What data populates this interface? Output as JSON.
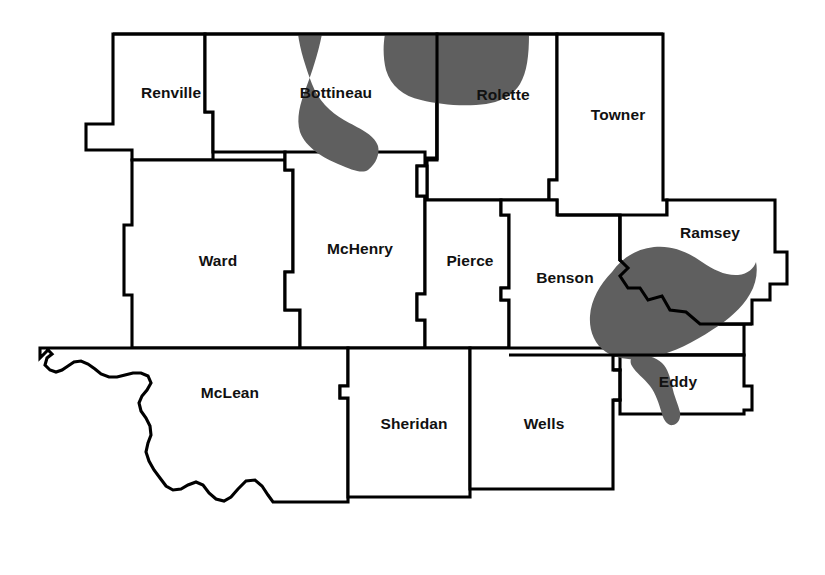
{
  "map": {
    "title": "North Dakota North Central Counties Map",
    "background_color": "#ffffff",
    "outline_color": "#000000",
    "water_color": "#5f5f5f",
    "label_color": "#111111",
    "water_feature_name": "Devils Lake and connected waters",
    "counties": [
      {
        "id": "renville",
        "name": "Renville",
        "label_x": 171,
        "label_y": 93
      },
      {
        "id": "bottineau",
        "name": "Bottineau",
        "label_x": 336,
        "label_y": 93
      },
      {
        "id": "rolette",
        "name": "Rolette",
        "label_x": 503,
        "label_y": 95
      },
      {
        "id": "towner",
        "name": "Towner",
        "label_x": 618,
        "label_y": 115
      },
      {
        "id": "ward",
        "name": "Ward",
        "label_x": 218,
        "label_y": 261
      },
      {
        "id": "mchenry",
        "name": "McHenry",
        "label_x": 360,
        "label_y": 249
      },
      {
        "id": "pierce",
        "name": "Pierce",
        "label_x": 470,
        "label_y": 261
      },
      {
        "id": "benson",
        "name": "Benson",
        "label_x": 565,
        "label_y": 278
      },
      {
        "id": "ramsey",
        "name": "Ramsey",
        "label_x": 710,
        "label_y": 233
      },
      {
        "id": "eddy",
        "name": "Eddy",
        "label_x": 678,
        "label_y": 382
      },
      {
        "id": "mclean",
        "name": "McLean",
        "label_x": 230,
        "label_y": 393
      },
      {
        "id": "sheridan",
        "name": "Sheridan",
        "label_x": 414,
        "label_y": 424
      },
      {
        "id": "wells",
        "name": "Wells",
        "label_x": 544,
        "label_y": 424
      }
    ]
  }
}
